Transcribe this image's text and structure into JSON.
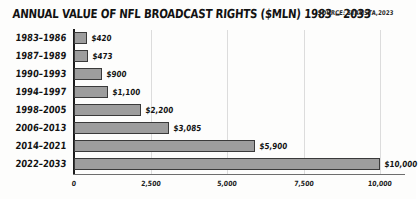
{
  "header": {
    "title": "ANNUAL VALUE OF NFL BROADCAST RIGHTS ($MLN) 1983 – 2033",
    "source": "SOURCE: STATISTA,2023"
  },
  "chart_data": {
    "type": "bar",
    "orientation": "horizontal",
    "title": "ANNUAL VALUE OF NFL BROADCAST RIGHTS ($MLN) 1983 – 2033",
    "subtitle": "SOURCE: STATISTA,2023",
    "xlabel": "",
    "ylabel": "",
    "xlim": [
      0,
      10800
    ],
    "grid": true,
    "legend": false,
    "bar_color": "#9d9d9d",
    "bar_edge_color": "#3a3a3a",
    "categories": [
      "1983–1986",
      "1987–1989",
      "1990–1993",
      "1994–1997",
      "1998–2005",
      "2006–2013",
      "2014–2021",
      "2022–2033"
    ],
    "values": [
      420,
      473,
      900,
      1100,
      2200,
      3085,
      5900,
      10000
    ],
    "value_labels": [
      "$420",
      "$473",
      "$900",
      "$1,100",
      "$2,200",
      "$3,085",
      "$5,900",
      "$10,000"
    ],
    "xticks": [
      0,
      2500,
      5000,
      7500,
      10000
    ],
    "xtick_labels": [
      "0",
      "2,500",
      "5,000",
      "7,500",
      "10,000"
    ]
  }
}
